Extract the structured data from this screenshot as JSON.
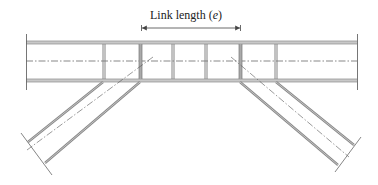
{
  "diagram": {
    "label": {
      "text_prefix": "Link length (",
      "symbol": "e",
      "text_suffix": ")"
    },
    "colors": {
      "line": "#6b6b6b",
      "flange": "#8a8a8a",
      "centerline": "#555555",
      "background": "#ffffff"
    },
    "beam": {
      "top_flange_y": 42.5,
      "bottom_flange_y": 80.5,
      "centerline_y": 61,
      "x_start": 26,
      "x_end": 357
    },
    "stiffeners_x": [
      104,
      140,
      173,
      206,
      240,
      276
    ],
    "link": {
      "x_start": 140,
      "x_end": 240,
      "arrow_y": 28
    },
    "braces": [
      {
        "side": "left",
        "edge1": [
          [
            103,
            82
          ],
          [
            28,
            142
          ]
        ],
        "edge2": [
          [
            140,
            82
          ],
          [
            45,
            163
          ]
        ],
        "centerline": [
          [
            153,
            57
          ],
          [
            27,
            150
          ]
        ],
        "end_cap": [
          [
            21,
            133
          ],
          [
            52,
            175
          ]
        ]
      },
      {
        "side": "right",
        "edge1": [
          [
            240,
            82
          ],
          [
            338,
            165
          ]
        ],
        "edge2": [
          [
            276,
            82
          ],
          [
            354,
            145
          ]
        ],
        "centerline": [
          [
            231,
            57
          ],
          [
            349,
            157
          ]
        ],
        "end_cap": [
          [
            361,
            137
          ],
          [
            335,
            172
          ]
        ]
      }
    ]
  }
}
